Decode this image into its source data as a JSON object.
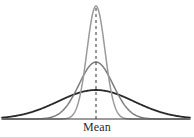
{
  "figure": {
    "label_mean": "Mean",
    "width": 194,
    "height": 138,
    "background_color": "#ffffff"
  },
  "axis": {
    "baseline_y": 119,
    "baseline_x_start": 2,
    "baseline_x_end": 190,
    "baseline_color": "#3a3a3a",
    "baseline_width": 1.2
  },
  "mean_line": {
    "x": 96,
    "y_top": 8,
    "y_bottom": 119,
    "color": "#333333",
    "dash": "3,3",
    "width": 1
  },
  "chart_data": {
    "type": "line",
    "title": "",
    "subtitle": "",
    "xlabel": "Mean",
    "ylabel": "",
    "grid": false,
    "legend_position": "none",
    "annotations": [
      {
        "text": "Mean",
        "x": 96,
        "y": 127,
        "kind": "axis-center-label"
      }
    ],
    "axis_ranges": {
      "xlim": [
        2,
        190
      ],
      "ylim": [
        0,
        1
      ]
    },
    "series": [
      {
        "name": "narrow-tall-curve",
        "distribution": "normal",
        "mean_x": 96,
        "std_px": 9,
        "peak_y": 6,
        "peak_height_px": 113,
        "relative_peak": 1.0,
        "relative_spread": 0.34,
        "color": "#9a9a9a",
        "stroke_width": 1.5,
        "x": [
          75,
          80,
          85,
          90,
          93,
          96,
          99,
          102,
          107,
          112,
          117
        ],
        "y_height_norm": [
          0.02,
          0.09,
          0.3,
          0.71,
          0.92,
          1.0,
          0.92,
          0.71,
          0.3,
          0.09,
          0.02
        ]
      },
      {
        "name": "medium-curve",
        "distribution": "normal",
        "mean_x": 96,
        "std_px": 17,
        "peak_y": 62,
        "peak_height_px": 57,
        "relative_peak": 0.5,
        "relative_spread": 0.64,
        "color": "#7d7d7d",
        "stroke_width": 1.5,
        "x": [
          58,
          66,
          74,
          82,
          89,
          96,
          103,
          110,
          118,
          126,
          134
        ],
        "y_height_norm": [
          0.02,
          0.09,
          0.3,
          0.63,
          0.91,
          1.0,
          0.91,
          0.63,
          0.3,
          0.09,
          0.02
        ]
      },
      {
        "name": "wide-flat-curve",
        "distribution": "normal",
        "mean_x": 96,
        "std_px": 38,
        "peak_y": 90,
        "peak_height_px": 29,
        "relative_peak": 0.26,
        "relative_spread": 1.0,
        "color": "#2a2a2a",
        "stroke_width": 1.8,
        "x": [
          2,
          20,
          38,
          56,
          76,
          96,
          116,
          136,
          154,
          172,
          190
        ],
        "y_height_norm": [
          0.02,
          0.09,
          0.26,
          0.52,
          0.86,
          1.0,
          0.86,
          0.52,
          0.26,
          0.09,
          0.02
        ]
      }
    ]
  }
}
